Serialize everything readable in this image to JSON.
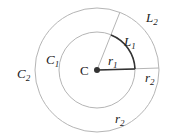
{
  "diagram": {
    "type": "concentric-circles-arc-length",
    "center_label": "C",
    "inner_circle": {
      "label": "C",
      "subscript": "1",
      "radius_label": "r",
      "radius_subscript": "1",
      "arc_label": "L",
      "arc_subscript": "1"
    },
    "outer_circle": {
      "label": "C",
      "subscript": "2",
      "radius_label": "r",
      "radius_subscript": "2",
      "arc_label": "L",
      "arc_subscript": "2"
    },
    "extra_labels": [
      {
        "text": "r",
        "subscript": "2",
        "position": "right-between-circles"
      },
      {
        "text": "r",
        "subscript": "2",
        "position": "bottom-between-circles"
      }
    ],
    "colors": {
      "circle_stroke": "#b5b5b5",
      "arc_stroke": "#333333",
      "text": "#222222"
    }
  }
}
